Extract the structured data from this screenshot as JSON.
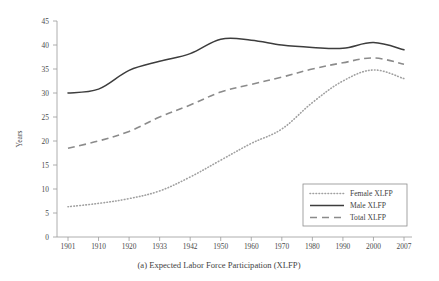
{
  "figure": {
    "caption": "(a) Expected Labor Force Participation (XLFP)",
    "ylabel": "Years"
  },
  "legend": {
    "items": [
      {
        "label": "Female XLFP",
        "style": "dotted",
        "color": "#a0a0a0"
      },
      {
        "label": "Male XLFP",
        "style": "solid",
        "color": "#3d3d3d"
      },
      {
        "label": "Total XLFP",
        "style": "dashed",
        "color": "#8b8b8b"
      }
    ]
  },
  "axes": {
    "y_ticks": [
      "0",
      "5",
      "10",
      "15",
      "20",
      "25",
      "30",
      "35",
      "40",
      "45"
    ],
    "x_ticks": [
      "1901",
      "1910",
      "1920",
      "1933",
      "1942",
      "1950",
      "1960",
      "1970",
      "1980",
      "1990",
      "2000",
      "2007"
    ]
  },
  "chart_data": {
    "type": "line",
    "title": "(a) Expected Labor Force Participation (XLFP)",
    "xlabel": "",
    "ylabel": "Years",
    "categories": [
      "1901",
      "1910",
      "1920",
      "1933",
      "1942",
      "1950",
      "1960",
      "1970",
      "1980",
      "1990",
      "2000",
      "2007"
    ],
    "ylim": [
      0,
      45
    ],
    "ytick_step": 5,
    "grid": false,
    "legend_position": "lower-right-inside",
    "series": [
      {
        "name": "Female XLFP",
        "style": "dotted",
        "color": "#a0a0a0",
        "values": [
          6.3,
          7.0,
          8.0,
          9.6,
          12.5,
          16.0,
          19.5,
          22.5,
          28.0,
          32.5,
          34.8,
          33.0
        ]
      },
      {
        "name": "Male XLFP",
        "style": "solid",
        "color": "#3d3d3d",
        "values": [
          30.0,
          30.8,
          34.7,
          36.6,
          38.2,
          41.2,
          41.0,
          40.0,
          39.5,
          39.3,
          40.5,
          39.0
        ]
      },
      {
        "name": "Total XLFP",
        "style": "dashed",
        "color": "#8b8b8b",
        "values": [
          18.5,
          20.0,
          22.0,
          25.0,
          27.5,
          30.2,
          31.8,
          33.3,
          35.0,
          36.3,
          37.3,
          36.0
        ]
      }
    ]
  }
}
